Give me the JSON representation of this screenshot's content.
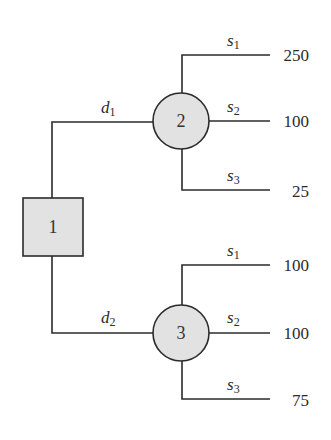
{
  "diagram": {
    "type": "decision-tree",
    "decision_node": {
      "id": "1",
      "label": "1"
    },
    "chance_nodes": [
      {
        "id": "2",
        "label": "2"
      },
      {
        "id": "3",
        "label": "3"
      }
    ],
    "decisions": [
      {
        "name": "d",
        "sub": "1",
        "to": "2"
      },
      {
        "name": "d",
        "sub": "2",
        "to": "3"
      }
    ],
    "outcomes": {
      "node2": [
        {
          "state": "s",
          "sub": "1",
          "value": "250"
        },
        {
          "state": "s",
          "sub": "2",
          "value": "100"
        },
        {
          "state": "s",
          "sub": "3",
          "value": "25"
        }
      ],
      "node3": [
        {
          "state": "s",
          "sub": "1",
          "value": "100"
        },
        {
          "state": "s",
          "sub": "2",
          "value": "100"
        },
        {
          "state": "s",
          "sub": "3",
          "value": "75"
        }
      ]
    },
    "colors": {
      "node_fill": "#e2e2e2",
      "stroke": "#2b2b2b"
    }
  }
}
